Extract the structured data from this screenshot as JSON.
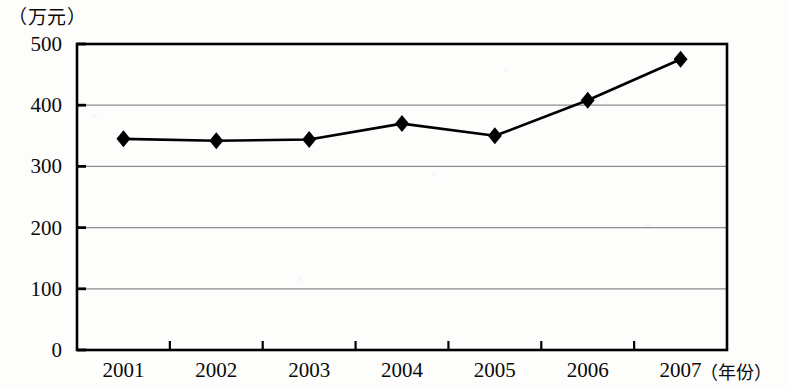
{
  "chart_data": {
    "type": "line",
    "title": "",
    "subtitle": "",
    "unit_label": "（万元）",
    "xlabel": "（年份）",
    "ylabel": "",
    "categories": [
      "2001",
      "2002",
      "2003",
      "2004",
      "2005",
      "2006",
      "2007"
    ],
    "values": [
      345,
      342,
      344,
      370,
      350,
      408,
      475
    ],
    "series": [
      {
        "name": "",
        "values": [
          345,
          342,
          344,
          370,
          350,
          408,
          475
        ],
        "marker": "diamond",
        "color": "#000000"
      }
    ],
    "ylim": [
      0,
      500
    ],
    "yticks": [
      0,
      100,
      200,
      300,
      400,
      500
    ],
    "ytick_labels": [
      "0",
      "100",
      "200",
      "300",
      "400",
      "500"
    ],
    "xtick_labels": [
      "2001",
      "2002",
      "2003",
      "2004",
      "2005",
      "2006",
      "2007"
    ],
    "grid": {
      "horizontal": true,
      "vertical": false,
      "color": "#8c8c8c"
    },
    "legend": {
      "visible": false,
      "position": "none",
      "entries": []
    },
    "frame": {
      "border": true,
      "border_color": "#000000"
    },
    "annotations": []
  },
  "axis": {
    "unit_caption": "（万元）",
    "x_caption": "（年份）"
  }
}
